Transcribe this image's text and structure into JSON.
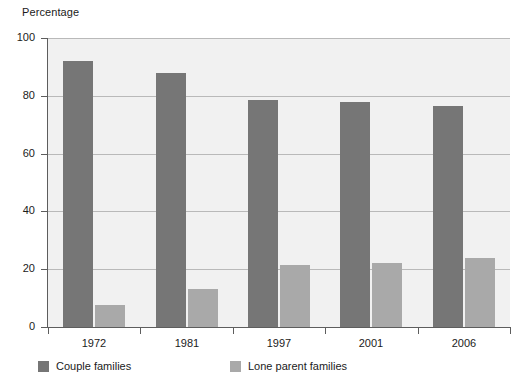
{
  "chart_data": {
    "type": "bar",
    "title": "",
    "subtitle": "",
    "xlabel": "",
    "ylabel": "Percentage",
    "ylim": [
      0,
      100
    ],
    "ytick_values": [
      0,
      20,
      40,
      60,
      80,
      100
    ],
    "ytick_labels": [
      "0",
      "20",
      "40",
      "60",
      "80",
      "100"
    ],
    "grid": true,
    "legend_position": "bottom",
    "categories": [
      "1972",
      "1981",
      "1997",
      "2001",
      "2006"
    ],
    "series": [
      {
        "name": "Couple families",
        "color": "#767676",
        "values": [
          92,
          88,
          78.5,
          78,
          76.5
        ]
      },
      {
        "name": "Lone parent families",
        "color": "#a9a9a9",
        "values": [
          7.5,
          13,
          21.5,
          22,
          24
        ]
      }
    ]
  },
  "colors": {
    "plot_background": "#f1f1f1",
    "page_background": "#ffffff",
    "axis": "#5d5d5d",
    "gridline": "#b9b9b9",
    "text": "#1b1b1b",
    "series_0": "#767676",
    "series_1": "#a9a9a9"
  }
}
